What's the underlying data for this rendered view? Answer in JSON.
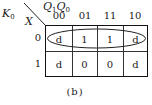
{
  "figure": {
    "output_label": "K",
    "output_subscript": "0",
    "column_var": {
      "v1": "Q",
      "s1": "1",
      "v2": "Q",
      "s2": "0"
    },
    "row_var": "X",
    "column_headers": [
      "00",
      "01",
      "11",
      "10"
    ],
    "row_headers": [
      "0",
      "1"
    ],
    "cells": [
      [
        "d",
        "1",
        "1",
        "d"
      ],
      [
        "d",
        "0",
        "0",
        "d"
      ]
    ],
    "grouping": "ellipse around entire row X=0",
    "caption": "(b)"
  }
}
